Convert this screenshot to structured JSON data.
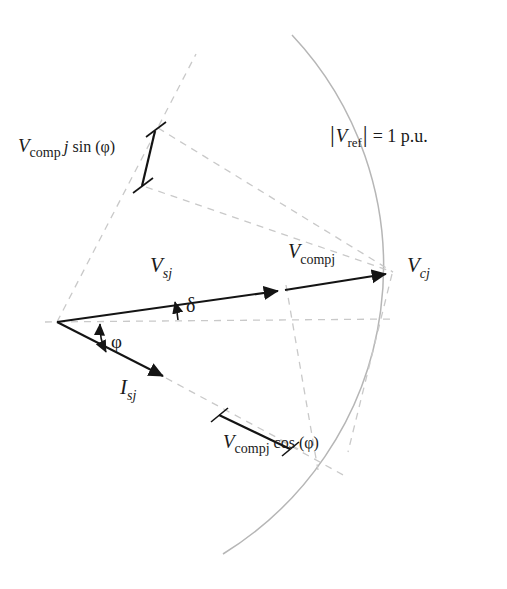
{
  "figure": {
    "type": "phasor-diagram",
    "title_visible": false,
    "background_color": "#ffffff",
    "solid_line_color": "#141414",
    "dashed_line_color": "#c9c9c9",
    "arc_color": "#b4b4b4"
  },
  "labels": {
    "v_comp_sin": {
      "full_text": "Vcomp j sin (φ)",
      "main": "V",
      "sub": "comp",
      "mid": "j",
      "tail": "sin (φ)",
      "x": 18,
      "y": 152
    },
    "v_ref": {
      "full_text": "|Vref| = 1 p.u.",
      "bar_left": "|",
      "main": "V",
      "sub": "ref",
      "bar_right": "|",
      "tail": "= 1 p.u.",
      "x": 330,
      "y": 142
    },
    "v_sj": {
      "full_text": "Vsj",
      "main": "V",
      "sub": "sj",
      "x": 150,
      "y": 272
    },
    "v_compj": {
      "full_text": "Vcompj",
      "main": "V",
      "sub": "compj",
      "x": 288,
      "y": 258
    },
    "v_cj": {
      "full_text": "Vcj",
      "main": "V",
      "sub": "cj",
      "x": 407,
      "y": 272
    },
    "i_sj": {
      "full_text": "Isj",
      "main": "I",
      "sub": "sj",
      "x": 120,
      "y": 394
    },
    "v_comp_cos": {
      "full_text": "Vcompj cos (φ)",
      "main": "V",
      "sub": "compj",
      "tail": "cos (φ)",
      "x": 223,
      "y": 448
    },
    "delta": {
      "full_text": "δ",
      "x": 186,
      "y": 312
    },
    "phi": {
      "full_text": "φ",
      "x": 111,
      "y": 348
    }
  },
  "geometry": {
    "origin": {
      "x": 57,
      "y": 322
    },
    "reference_magnitude": "1 p.u.",
    "vectors": [
      {
        "name": "V_sj",
        "from_x": 57,
        "from_y": 322,
        "to_x": 285,
        "to_y": 290
      },
      {
        "name": "V_compj",
        "from_x": 285,
        "from_y": 290,
        "to_x": 392,
        "to_y": 273
      },
      {
        "name": "I_sj",
        "from_x": 57,
        "from_y": 322,
        "to_x": 170,
        "to_y": 380
      }
    ],
    "angles": [
      {
        "name": "delta",
        "symbol": "δ",
        "between": "horizontal reference and V_sj"
      },
      {
        "name": "phi",
        "symbol": "φ",
        "between": "horizontal reference and I_sj"
      }
    ],
    "arc": {
      "name": "unit-circle-arc",
      "center_x": 57,
      "center_y": 322,
      "radius": 338,
      "start_deg": -61,
      "end_deg": 46
    }
  }
}
